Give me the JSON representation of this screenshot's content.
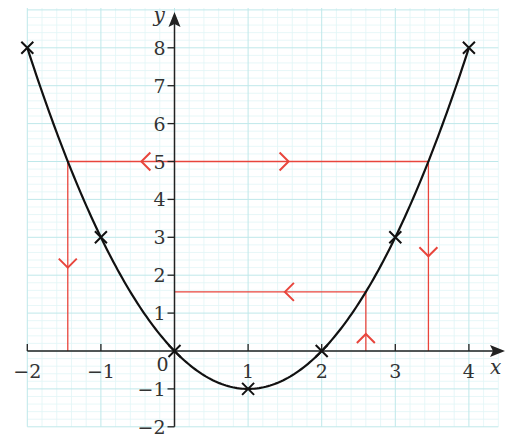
{
  "chart_data": {
    "type": "line",
    "title": "",
    "xlabel": "x",
    "ylabel": "y",
    "xlim": [
      -2,
      4.1
    ],
    "ylim": [
      -2,
      9
    ],
    "x_ticks": [
      -2,
      -1,
      0,
      1,
      2,
      3,
      4
    ],
    "x_tick_labels": [
      "−2",
      "−1",
      "0",
      "1",
      "2",
      "3",
      "4"
    ],
    "y_ticks": [
      -2,
      -1,
      1,
      2,
      3,
      4,
      5,
      6,
      7,
      8
    ],
    "y_tick_labels": [
      "−2",
      "−1",
      "1",
      "2",
      "3",
      "4",
      "5",
      "6",
      "7",
      "8"
    ],
    "grid": {
      "major_step": 1,
      "minor_step": 0.2,
      "on": true
    },
    "curve": {
      "name": "y = x² − 2x",
      "equation": "x^2 - 2x",
      "x_range": [
        -2,
        4
      ],
      "color": "#111111"
    },
    "plotted_points": [
      {
        "x": -2,
        "y": 8
      },
      {
        "x": -1,
        "y": 3
      },
      {
        "x": 0,
        "y": 0
      },
      {
        "x": 1,
        "y": -1
      },
      {
        "x": 2,
        "y": 0
      },
      {
        "x": 3,
        "y": 3
      },
      {
        "x": 4,
        "y": 8
      }
    ],
    "annotations": [
      {
        "name": "y=5 reading",
        "color": "#e8453c",
        "horizontal": {
          "y": 5,
          "x_from": -1.45,
          "x_to": 3.45
        },
        "verticals": [
          {
            "x": -1.45,
            "y_from": 5,
            "y_to": 0
          },
          {
            "x": 3.45,
            "y_from": 5,
            "y_to": 0
          }
        ],
        "arrows": [
          {
            "x": -0.45,
            "y": 5,
            "dir": "left"
          },
          {
            "x": 1.55,
            "y": 5,
            "dir": "right"
          },
          {
            "x": -1.45,
            "y": 2.2,
            "dir": "down"
          },
          {
            "x": 3.45,
            "y": 2.5,
            "dir": "down"
          }
        ],
        "solutions_x": [
          -1.45,
          3.45
        ]
      },
      {
        "name": "x=2.6 reading",
        "color": "#e8453c",
        "vertical": {
          "x": 2.6,
          "y_from": 0,
          "y_to": 1.56
        },
        "horizontal": {
          "y": 1.56,
          "x_from": 2.6,
          "x_to": 0
        },
        "arrows": [
          {
            "x": 2.6,
            "y": 0.45,
            "dir": "up"
          },
          {
            "x": 1.5,
            "y": 1.56,
            "dir": "left"
          }
        ],
        "reading_y": 1.56
      }
    ]
  },
  "colors": {
    "grid_major": "#bfe8ea",
    "grid_minor": "#e1f5f6",
    "axis": "#222222",
    "curve": "#111111",
    "annotation": "#e8453c",
    "text": "#333333"
  }
}
